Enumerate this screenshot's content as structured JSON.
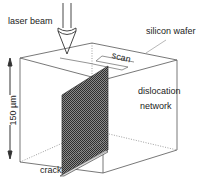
{
  "figure": {
    "type": "schematic",
    "labels": {
      "laser_beam": "laser beam",
      "silicon_wafer": "silicon wafer",
      "scan": "scan",
      "dislocation": "dislocation",
      "network": "network",
      "crack": "crack",
      "scale": "150 µm"
    },
    "colors": {
      "line": "#555555",
      "hatch_dark": "#3a3a3a",
      "hatch_light": "#9a9a9a",
      "background": "#ffffff"
    }
  }
}
